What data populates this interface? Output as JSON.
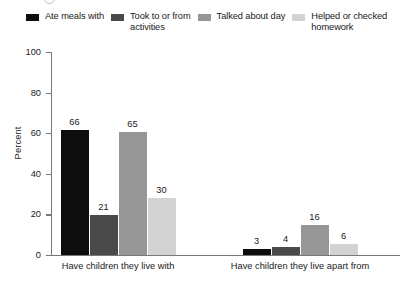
{
  "chart_data": {
    "type": "bar",
    "title": "",
    "xlabel": "",
    "ylabel": "Percent",
    "ylim": [
      0,
      100
    ],
    "yticks": [
      0,
      20,
      40,
      60,
      80,
      100
    ],
    "grid": false,
    "legend_position": "top",
    "categories": [
      "Have children they live with",
      "Have children they live apart from"
    ],
    "series": [
      {
        "name": "Ate meals with",
        "color": "#0d0d0d",
        "values": [
          66,
          3
        ]
      },
      {
        "name": "Took to or from\nactivities",
        "color": "#4a4a4a",
        "values": [
          21,
          4
        ]
      },
      {
        "name": "Talked about day",
        "color": "#969696",
        "values": [
          65,
          16
        ]
      },
      {
        "name": "Helped or checked\nhomework",
        "color": "#d2d2d2",
        "values": [
          30,
          6
        ]
      }
    ]
  }
}
